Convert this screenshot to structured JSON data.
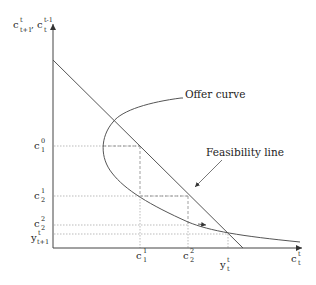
{
  "axes": {
    "y_label": {
      "base": "c",
      "sup1": "t",
      "sub1": "t+1",
      "sep": ", ",
      "base2": "c",
      "sup2": "t-1",
      "sub2": "t"
    },
    "x_label": {
      "base": "c",
      "sup": "t",
      "sub": "t"
    }
  },
  "curves": {
    "offer_curve_label": "Offer curve",
    "feasibility_line_label": "Feasibility line"
  },
  "y_ticks": [
    {
      "base": "c",
      "sup": "0",
      "sub": "1"
    },
    {
      "base": "c",
      "sup": "1",
      "sub": "2"
    },
    {
      "base": "c",
      "sup": "2",
      "sub": "2"
    },
    {
      "base": "y",
      "sup": "t",
      "sub": "t+1"
    }
  ],
  "x_ticks": [
    {
      "base": "c",
      "sup": "1",
      "sub": "1"
    },
    {
      "base": "c",
      "sup": "2",
      "sub": "2"
    },
    {
      "base": "y",
      "sup": "t",
      "sub": "t"
    }
  ],
  "colors": {
    "line": "#555555",
    "dotted": "#999999",
    "text": "#222222"
  }
}
